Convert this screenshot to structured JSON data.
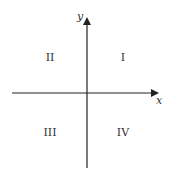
{
  "diagram": {
    "axes": {
      "x_label": "x",
      "y_label": "y",
      "color": "#222222"
    },
    "quadrants": [
      {
        "id": "I",
        "label": "I"
      },
      {
        "id": "II",
        "label": "II"
      },
      {
        "id": "III",
        "label": "III"
      },
      {
        "id": "IV",
        "label": "IV"
      }
    ]
  }
}
